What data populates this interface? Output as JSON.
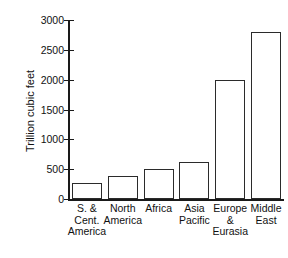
{
  "chart_data": {
    "type": "bar",
    "title": "",
    "xlabel": "",
    "ylabel": "Trillion cubic feet",
    "ylim": [
      0,
      3000
    ],
    "ytick_labels": [
      "3000",
      "2500",
      "2000",
      "1500",
      "1000",
      "500",
      "0"
    ],
    "yticks": [
      3000,
      2500,
      2000,
      1500,
      1000,
      500,
      0
    ],
    "grid": false,
    "legend": null,
    "categories": [
      "S. &\nCent.\nAmerica",
      "North\nAmerica",
      "Africa",
      "Asia\nPacific",
      "Europe\n&\nEurasia",
      "Middle\nEast"
    ],
    "values": [
      270,
      390,
      500,
      620,
      2000,
      2800
    ],
    "bar_facecolor": "#ffffff",
    "bar_edgecolor": "#2b2b2b",
    "axis_color": "#1a1a1a",
    "background": "#ffffff"
  }
}
